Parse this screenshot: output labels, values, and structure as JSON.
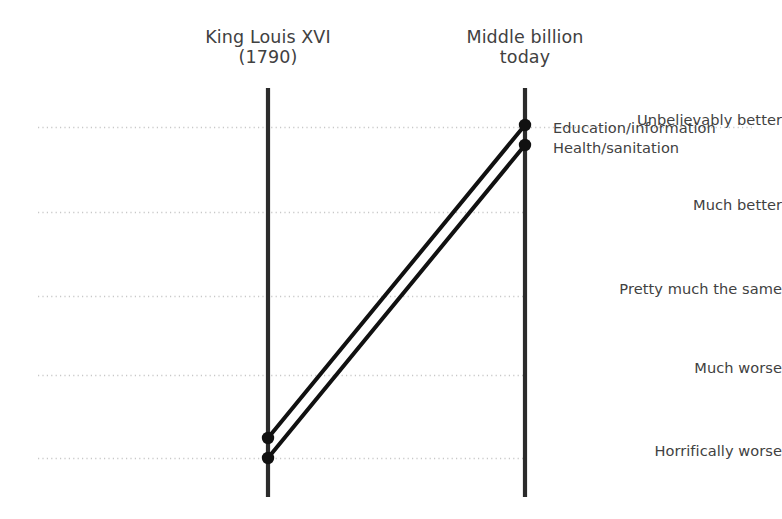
{
  "chart_data": {
    "type": "line",
    "subtype": "slope-chart",
    "title": "",
    "xlabel": "",
    "ylabel": "",
    "columns": [
      {
        "id": "left",
        "label": "King Louis XVI\n(1790)",
        "x": 268
      },
      {
        "id": "right",
        "label": "Middle billion\ntoday",
        "x": 525
      }
    ],
    "categories": [
      "Unbelievably better",
      "Much better",
      "Pretty much the same",
      "Much worse",
      "Horrifically worse"
    ],
    "category_gridlines_y": [
      127,
      212,
      296,
      375,
      458
    ],
    "grid": true,
    "grid_style": "dotted",
    "grid_color": "#c8c8c8",
    "legend_position": "right-inline",
    "series": [
      {
        "name": "Education/information",
        "label": "Education/information",
        "start_category": "Horrifically worse",
        "end_category": "Unbelievably better",
        "points": [
          {
            "x": 268,
            "y": 438
          },
          {
            "x": 525,
            "y": 125
          }
        ],
        "label_y": 119,
        "color": "#111111"
      },
      {
        "name": "Health/sanitation",
        "label": "Health/sanitation",
        "start_category": "Horrifically worse",
        "end_category": "Unbelievably better",
        "points": [
          {
            "x": 268,
            "y": 458
          },
          {
            "x": 525,
            "y": 145
          }
        ],
        "label_y": 139,
        "color": "#111111"
      }
    ],
    "axis_color": "#2b2b2b",
    "axis_top": 88,
    "axis_bottom": 497,
    "text_color": "#414141"
  },
  "headers": {
    "left": "King Louis XVI\n(1790)",
    "right": "Middle billion\ntoday"
  },
  "categories": {
    "c0": "Unbelievably better",
    "c1": "Much better",
    "c2": "Pretty much the same",
    "c3": "Much worse",
    "c4": "Horrifically worse"
  },
  "point_labels": {
    "education": "Education/information",
    "health": "Health/sanitation"
  }
}
